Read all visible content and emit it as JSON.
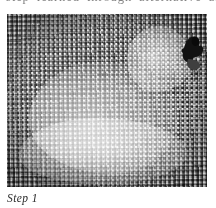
{
  "page": {
    "background_color": "#ffffff",
    "text_color": "#2a2a2a"
  },
  "top_text": {
    "clipped_line": "step learned through alternative an"
  },
  "figure": {
    "alt_name": "needlepoint-canvas-photo",
    "colors": {
      "canvas_mid_gray": "#9a9a9a",
      "stitch_light": "#f0f0f0",
      "thread_dark": "#141414",
      "thread_dark_shadow": "#4a4a4a"
    }
  },
  "caption": {
    "text": "Step 1"
  }
}
